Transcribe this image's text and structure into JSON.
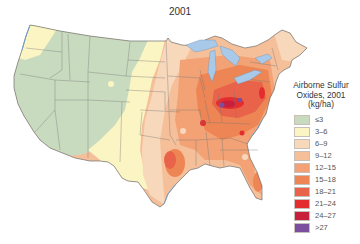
{
  "title": "2001",
  "legend": {
    "title_line1": "Airborne Sulfur",
    "title_line2": "Oxides, 2001",
    "title_line3": "(kg/ha)",
    "items": [
      {
        "label": "≤3",
        "color": "#c9dbbf"
      },
      {
        "label": "3–6",
        "color": "#fbf5c3"
      },
      {
        "label": "6–9",
        "color": "#f8d8bb"
      },
      {
        "label": "9–12",
        "color": "#f5bf9a"
      },
      {
        "label": "12–15",
        "color": "#f2a274"
      },
      {
        "label": "15–18",
        "color": "#ee8554"
      },
      {
        "label": "18–21",
        "color": "#e8634a"
      },
      {
        "label": "21–24",
        "color": "#e32d2f"
      },
      {
        "label": "24–27",
        "color": "#c8203c"
      },
      {
        "label": ">27",
        "color": "#7b4e9e"
      }
    ]
  },
  "map": {
    "region": "Contiguous United States",
    "water_color": "#a9c9e8",
    "border_color": "#6f6f6f"
  }
}
